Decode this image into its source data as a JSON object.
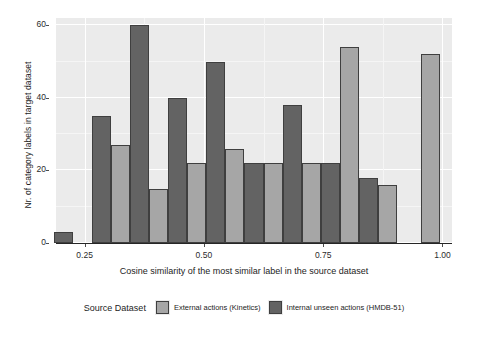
{
  "chart_data": {
    "type": "bar",
    "title": "",
    "subtitle": "",
    "xlabel": "Cosine similarity of the most similar label in the source dataset",
    "ylabel": "Nr. of category labels in target dataset",
    "xlim": [
      0.19,
      1.02
    ],
    "ylim": [
      0,
      62
    ],
    "xticks": [
      "0.25",
      "0.50",
      "0.75",
      "1.00"
    ],
    "xtick_values": [
      0.25,
      0.5,
      0.75,
      1.0
    ],
    "yticks": [
      "0",
      "20",
      "40",
      "60"
    ],
    "ytick_values": [
      0,
      20,
      40,
      60
    ],
    "grid": true,
    "legend_position": "bottom",
    "legend_title": "Source Dataset",
    "series": [
      {
        "name": "External actions (Kinetics)",
        "color": "#a6a6a6",
        "bins": [
          0.225,
          0.305,
          0.385,
          0.465,
          0.545,
          0.625,
          0.705,
          0.785,
          0.865,
          0.955
        ],
        "values": [
          0,
          27,
          15,
          22,
          26,
          22,
          22,
          54,
          16,
          52
        ]
      },
      {
        "name": "Internal unseen actions (HMDB-51)",
        "color": "#636363",
        "bins": [
          0.225,
          0.305,
          0.385,
          0.465,
          0.545,
          0.625,
          0.705,
          0.785,
          0.865,
          0.955
        ],
        "values": [
          3,
          35,
          60,
          40,
          50,
          22,
          38,
          22,
          18,
          0
        ]
      }
    ]
  },
  "legend": {
    "title": "Source Dataset",
    "items": [
      {
        "label": "External actions (Kinetics)",
        "key": "kinetics"
      },
      {
        "label": "Internal unseen actions (HMDB-51)",
        "key": "hmdb"
      }
    ]
  },
  "colors": {
    "panel_background": "#ebebeb",
    "gridline": "#ffffff",
    "kinetics": "#a6a6a6",
    "hmdb": "#636363",
    "bar_outline": "#3f3f3f",
    "axis": "#262626"
  }
}
